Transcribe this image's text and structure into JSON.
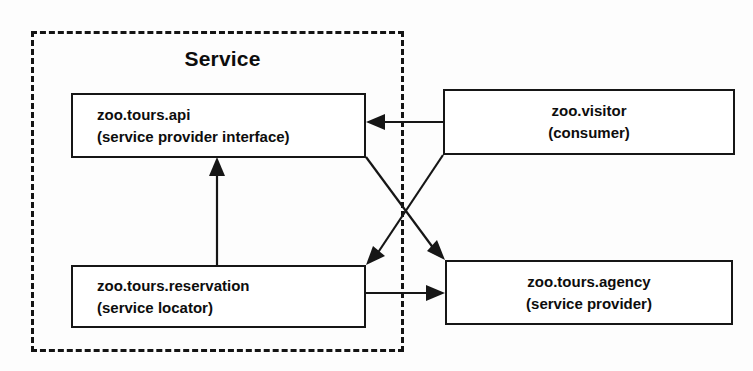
{
  "diagram": {
    "title": "Service",
    "type": "component-dependency-diagram",
    "boundary": {
      "label": "Service",
      "style": "dashed",
      "color": "#141414"
    },
    "nodes": [
      {
        "id": "api",
        "name": "zoo.tours.api",
        "role": "(service provider interface)",
        "inside_boundary": true,
        "align": "left"
      },
      {
        "id": "visitor",
        "name": "zoo.visitor",
        "role": "(consumer)",
        "inside_boundary": false,
        "align": "center"
      },
      {
        "id": "reservation",
        "name": "zoo.tours.reservation",
        "role": "(service locator)",
        "inside_boundary": true,
        "align": "left"
      },
      {
        "id": "agency",
        "name": "zoo.tours.agency",
        "role": "(service provider)",
        "inside_boundary": false,
        "align": "center"
      }
    ],
    "edges": [
      {
        "id": "visitor-to-api",
        "from": "visitor",
        "to": "api",
        "direction": "left"
      },
      {
        "id": "reservation-to-api",
        "from": "reservation",
        "to": "api",
        "direction": "up"
      },
      {
        "id": "api-to-agency",
        "from": "api",
        "to": "agency",
        "direction": "down-right"
      },
      {
        "id": "visitor-to-reservation",
        "from": "visitor",
        "to": "reservation",
        "direction": "down-left"
      },
      {
        "id": "reservation-to-agency",
        "from": "reservation",
        "to": "agency",
        "direction": "right"
      }
    ],
    "colors": {
      "stroke": "#161616",
      "text": "#0d0d0d",
      "background": "#ffffff"
    }
  }
}
